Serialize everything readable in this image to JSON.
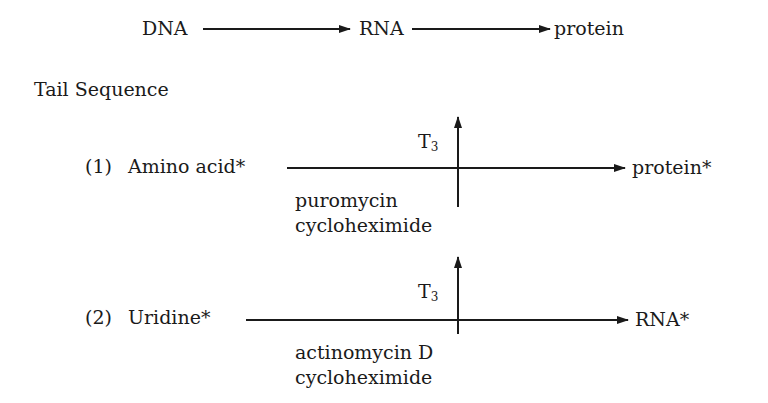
{
  "central_dogma": {
    "nodes": [
      "DNA",
      "RNA",
      "protein"
    ]
  },
  "section_title": "Tail Sequence",
  "pathways": [
    {
      "index": "(1)",
      "substrate": "Amino acid*",
      "product": "protein*",
      "stimulator": "T",
      "stimulator_sub": "3",
      "inhibitors": [
        "puromycin",
        "cycloheximide"
      ]
    },
    {
      "index": "(2)",
      "substrate": "Uridine*",
      "product": "RNA*",
      "stimulator": "T",
      "stimulator_sub": "3",
      "inhibitors": [
        "actinomycin D",
        "cycloheximide"
      ]
    }
  ],
  "colors": {
    "ink": "#1a1a1a",
    "background": "#ffffff"
  }
}
